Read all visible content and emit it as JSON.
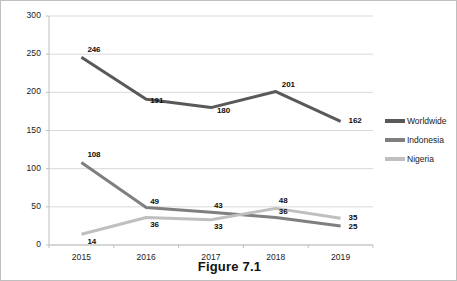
{
  "caption": "Figure 7.1",
  "legend": {
    "position": "right",
    "items": [
      {
        "label": "Worldwide",
        "color": "#595959"
      },
      {
        "label": "Indonesia",
        "color": "#7f7f7f"
      },
      {
        "label": "Nigeria",
        "color": "#bfbfbf"
      }
    ]
  },
  "axes": {
    "y_ticks": [
      "0",
      "50",
      "100",
      "150",
      "200",
      "250",
      "300"
    ],
    "x_ticks": [
      "2015",
      "2016",
      "2017",
      "2018",
      "2019"
    ]
  },
  "chart_data": {
    "type": "line",
    "title": "Figure 7.1",
    "xlabel": "",
    "ylabel": "",
    "x": [
      "2015",
      "2016",
      "2017",
      "2018",
      "2019"
    ],
    "categories": [
      "2015",
      "2016",
      "2017",
      "2018",
      "2019"
    ],
    "ylim": [
      0,
      300
    ],
    "ytick_step": 50,
    "grid": true,
    "legend_position": "right",
    "series": [
      {
        "name": "Worldwide",
        "color": "#595959",
        "values": [
          246,
          191,
          180,
          201,
          162
        ],
        "labels": [
          "246",
          "191",
          "180",
          "201",
          "162"
        ]
      },
      {
        "name": "Indonesia",
        "color": "#7f7f7f",
        "values": [
          108,
          49,
          43,
          36,
          25
        ],
        "labels": [
          "108",
          "49",
          "43",
          "36",
          "25"
        ]
      },
      {
        "name": "Nigeria",
        "color": "#bfbfbf",
        "values": [
          14,
          36,
          33,
          48,
          35
        ],
        "labels": [
          "14",
          "36",
          "33",
          "48",
          "35"
        ]
      }
    ]
  }
}
